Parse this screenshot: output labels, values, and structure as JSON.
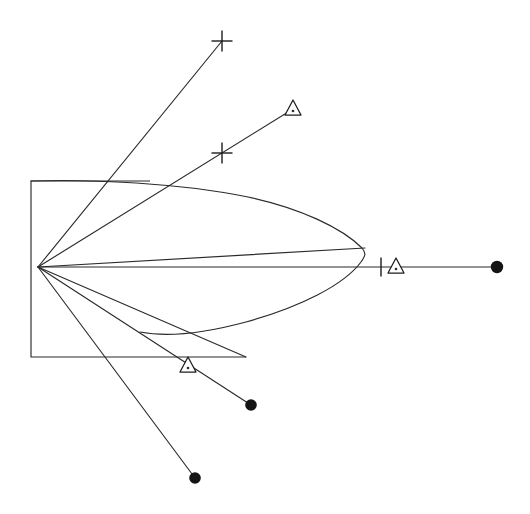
{
  "figure": {
    "background_color": "#ffffff",
    "line_color": "#2b2b2b",
    "marker_color": "#141414",
    "width": 530,
    "height": 514
  },
  "chart_data": {
    "type": "scatter",
    "title": "",
    "xlabel": "",
    "ylabel": "",
    "xlim": [
      0,
      530
    ],
    "ylim": [
      0,
      514
    ],
    "grid": false,
    "legend": "none",
    "origin": {
      "x": 38,
      "y": 267
    },
    "annotations": [
      "Seven straight rays radiate from a single common origin on the left.",
      "A closed lens / leaf shaped envelope curve surrounds the horizontal axis.",
      "An open rectangular boundary frames the left portion of the fan."
    ],
    "series": [
      {
        "name": "ray-1-upper-plus",
        "marker": "plus",
        "start": {
          "x": 38,
          "y": 267
        },
        "end": {
          "x": 222,
          "y": 41
        },
        "marker_points": [
          {
            "x": 222,
            "y": 41,
            "symbol": "plus"
          }
        ]
      },
      {
        "name": "ray-2-upper-triangle",
        "marker": "triangle",
        "start": {
          "x": 38,
          "y": 267
        },
        "end": {
          "x": 293,
          "y": 109
        },
        "marker_points": [
          {
            "x": 222,
            "y": 153,
            "symbol": "plus"
          },
          {
            "x": 293,
            "y": 109,
            "symbol": "triangle"
          }
        ]
      },
      {
        "name": "ray-3-envelope-tip",
        "marker": "none",
        "start": {
          "x": 38,
          "y": 267
        },
        "end": {
          "x": 365,
          "y": 248
        },
        "marker_points": []
      },
      {
        "name": "ray-4-horizontal-axis",
        "marker": "dot",
        "start": {
          "x": 38,
          "y": 267
        },
        "end": {
          "x": 497,
          "y": 267
        },
        "marker_points": [
          {
            "x": 381,
            "y": 267,
            "symbol": "tick"
          },
          {
            "x": 396,
            "y": 267,
            "symbol": "triangle"
          },
          {
            "x": 497,
            "y": 267,
            "symbol": "dot"
          }
        ]
      },
      {
        "name": "ray-5-lower-envelope",
        "marker": "none",
        "start": {
          "x": 38,
          "y": 267
        },
        "end": {
          "x": 246,
          "y": 357
        },
        "marker_points": []
      },
      {
        "name": "ray-6-lower-triangle-dot",
        "marker": "dot",
        "start": {
          "x": 38,
          "y": 267
        },
        "end": {
          "x": 251,
          "y": 405
        },
        "marker_points": [
          {
            "x": 188,
            "y": 366,
            "symbol": "triangle"
          },
          {
            "x": 251,
            "y": 405,
            "symbol": "dot"
          }
        ]
      },
      {
        "name": "ray-7-lower-far-dot",
        "marker": "dot",
        "start": {
          "x": 38,
          "y": 267
        },
        "end": {
          "x": 195,
          "y": 478
        },
        "marker_points": [
          {
            "x": 195,
            "y": 478,
            "symbol": "dot"
          }
        ]
      }
    ],
    "envelope": {
      "name": "lens-envelope",
      "description": "Closed leaf-shaped curve from origin region to right tip",
      "upper_path": [
        {
          "x": 31,
          "y": 181
        },
        {
          "x": 150,
          "y": 180
        },
        {
          "x": 240,
          "y": 192
        },
        {
          "x": 310,
          "y": 216
        },
        {
          "x": 352,
          "y": 238
        },
        {
          "x": 365,
          "y": 252
        }
      ],
      "lower_path": [
        {
          "x": 365,
          "y": 252
        },
        {
          "x": 352,
          "y": 278
        },
        {
          "x": 312,
          "y": 305
        },
        {
          "x": 258,
          "y": 326
        },
        {
          "x": 190,
          "y": 336
        },
        {
          "x": 140,
          "y": 332
        }
      ]
    },
    "boundary": {
      "name": "left-rectangular-frame",
      "points": [
        {
          "x": 150,
          "y": 181
        },
        {
          "x": 31,
          "y": 181
        },
        {
          "x": 31,
          "y": 357
        },
        {
          "x": 246,
          "y": 357
        }
      ]
    },
    "marker_legend": [
      {
        "symbol": "plus",
        "glyph": "+",
        "count": 2
      },
      {
        "symbol": "triangle",
        "glyph": "triangle-outline",
        "count": 3
      },
      {
        "symbol": "dot",
        "glyph": "filled-circle",
        "count": 3
      },
      {
        "symbol": "tick",
        "glyph": "vertical-bar",
        "count": 1
      }
    ]
  }
}
